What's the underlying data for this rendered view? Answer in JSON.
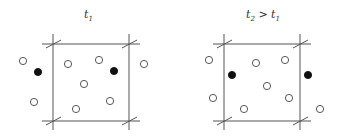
{
  "diagram": {
    "panels": [
      {
        "id": "t1",
        "title": {
          "main": "t",
          "sub": "1",
          "suffix": ""
        },
        "particles": [
          {
            "type": "open"
          },
          {
            "type": "filled"
          },
          {
            "type": "open"
          },
          {
            "type": "open"
          },
          {
            "type": "filled"
          },
          {
            "type": "open"
          },
          {
            "type": "open"
          },
          {
            "type": "open"
          },
          {
            "type": "open"
          },
          {
            "type": "open"
          }
        ]
      },
      {
        "id": "t2",
        "title": {
          "main": "t",
          "sub": "2",
          "suffix": " > t",
          "suffix_sub": "1"
        },
        "particles": [
          {
            "type": "open"
          },
          {
            "type": "open"
          },
          {
            "type": "open"
          },
          {
            "type": "filled"
          },
          {
            "type": "filled"
          },
          {
            "type": "open"
          },
          {
            "type": "open"
          },
          {
            "type": "open"
          },
          {
            "type": "open"
          },
          {
            "type": "open"
          }
        ]
      }
    ],
    "legend": {
      "open_circle": "particle",
      "filled_circle": "tracked particle (periodic image)"
    }
  }
}
